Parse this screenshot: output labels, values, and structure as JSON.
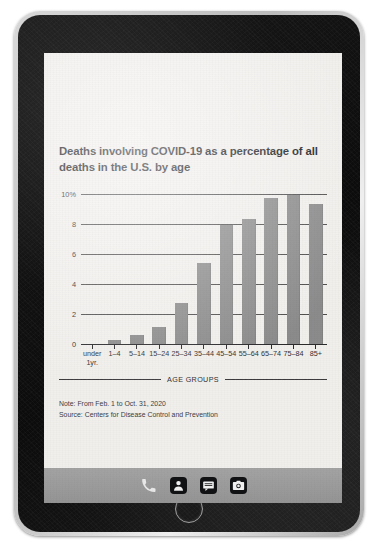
{
  "device": {
    "type": "tablet",
    "home_button": "home-button",
    "bezel_color": "#131313",
    "screen_color": "#f1efec"
  },
  "article": {
    "headline": "Deaths involving COVID-19 as a percentage of all deaths in the U.S. by age",
    "note": "Note: From Feb. 1 to Oct. 31, 2020",
    "source": "Source: Centers for Disease Control and Prevention"
  },
  "chart_data": {
    "type": "bar",
    "title": "Deaths involving COVID-19 as a percentage of all deaths in the U.S. by age",
    "xlabel": "AGE GROUPS",
    "ylabel": "",
    "categories": [
      "under 1yr.",
      "1–4",
      "5–14",
      "15–24",
      "25–34",
      "35–44",
      "45–54",
      "55–64",
      "65–74",
      "75–84",
      "85+"
    ],
    "values": [
      0.1,
      0.35,
      0.7,
      1.2,
      2.8,
      5.5,
      8.0,
      8.4,
      9.8,
      10.0,
      9.4
    ],
    "ylim": [
      0,
      10
    ],
    "yticks": [
      0,
      2,
      4,
      6,
      8,
      10
    ],
    "ytick_labels": [
      "0",
      "2",
      "4",
      "6",
      "8",
      "10%"
    ],
    "grid": true,
    "legend": false,
    "bar_color": "#8b8b8b",
    "axis_color": "#2a2a2c"
  },
  "dock": {
    "items": [
      {
        "name": "phone-icon",
        "label": "Phone"
      },
      {
        "name": "contacts-icon",
        "label": "Contacts"
      },
      {
        "name": "messages-icon",
        "label": "Messages"
      },
      {
        "name": "camera-icon",
        "label": "Camera"
      }
    ]
  }
}
